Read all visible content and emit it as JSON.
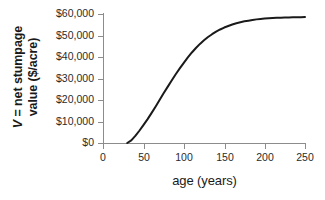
{
  "chart_data": {
    "type": "line",
    "title": "",
    "xlabel": "age (years)",
    "ylabel_parts": {
      "symbol": "V",
      "line1_rest": "= net stumpage",
      "line2": "value ($/acre)"
    },
    "ylabel": "V = net stumpage value ($/acre)",
    "xlim": [
      0,
      250
    ],
    "ylim": [
      0,
      60000
    ],
    "xticks": [
      0,
      50,
      100,
      150,
      200,
      250
    ],
    "xticklabels": [
      "0",
      "50",
      "100",
      "150",
      "200",
      "250"
    ],
    "yticks": [
      0,
      10000,
      20000,
      30000,
      40000,
      50000,
      60000
    ],
    "yticklabels": [
      "$0",
      "$10,000",
      "$20,000",
      "$30,000",
      "$40,000",
      "$50,000",
      "$60,000"
    ],
    "grid": false,
    "legend": false,
    "line_color": "#1a1a1a",
    "line_width": 2,
    "series": [
      {
        "name": "net stumpage value",
        "x": [
          0,
          5,
          10,
          15,
          20,
          25,
          30,
          35,
          40,
          45,
          50,
          55,
          60,
          65,
          70,
          75,
          80,
          85,
          90,
          95,
          100,
          105,
          110,
          115,
          120,
          125,
          130,
          135,
          140,
          145,
          150,
          155,
          160,
          165,
          170,
          175,
          180,
          185,
          190,
          195,
          200,
          205,
          210,
          215,
          220,
          225,
          230,
          235,
          240,
          245,
          250
        ],
        "y": [
          0,
          0,
          0,
          0,
          0,
          0,
          0,
          1200,
          3300,
          5700,
          8300,
          11000,
          13900,
          16900,
          20000,
          23100,
          26100,
          29100,
          32000,
          34700,
          37300,
          39800,
          42100,
          44200,
          46100,
          47800,
          49300,
          50600,
          51800,
          52800,
          53700,
          54400,
          55100,
          55700,
          56200,
          56600,
          56900,
          57200,
          57500,
          57700,
          57900,
          58000,
          58100,
          58200,
          58300,
          58350,
          58400,
          58450,
          58500,
          58500,
          58550
        ]
      }
    ],
    "annotations": {
      "zero_until_age": 30,
      "asymptote": 58500
    }
  },
  "axes": {
    "tick_color": "#8c8c8c",
    "text_color": "#2b2b2b"
  }
}
